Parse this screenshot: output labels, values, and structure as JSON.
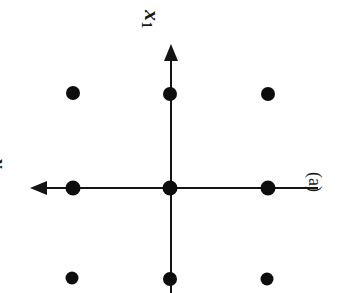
{
  "figure": {
    "caption_label": "(a)",
    "background_color": "#ffffff",
    "ink_color": "#111111",
    "width": 348,
    "height": 293,
    "rotation_note": "90"
  },
  "axes": {
    "vertical": {
      "name": "x1",
      "label_base": "x",
      "label_sub": "1",
      "arrow_direction": "up",
      "x": 170,
      "y_start": 293,
      "y_end": 48
    },
    "horizontal": {
      "name": "x2",
      "label_base": "x",
      "label_sub": "2",
      "arrow_direction": "left",
      "y": 188,
      "x_start": 318,
      "x_end": 33
    }
  },
  "points": [
    {
      "name": "point-top-left",
      "cx": 73,
      "cy": 93,
      "r": 7.0,
      "grid": "(-1, 1)"
    },
    {
      "name": "point-top-center",
      "cx": 170,
      "cy": 94,
      "r": 7.0,
      "grid": "(0, 1)"
    },
    {
      "name": "point-top-right",
      "cx": 268,
      "cy": 94,
      "r": 7.0,
      "grid": "(1, 1)"
    },
    {
      "name": "point-middle-left",
      "cx": 73,
      "cy": 188,
      "r": 7.5,
      "grid": "(-1, 0)"
    },
    {
      "name": "point-origin",
      "cx": 170,
      "cy": 188,
      "r": 7.5,
      "grid": "(0, 0)"
    },
    {
      "name": "point-middle-right",
      "cx": 268,
      "cy": 188,
      "r": 7.5,
      "grid": "(1, 0)"
    },
    {
      "name": "point-bottom-left",
      "cx": 72,
      "cy": 278,
      "r": 6.5,
      "grid": "(-1, -1)"
    },
    {
      "name": "point-bottom-center",
      "cx": 170,
      "cy": 279,
      "r": 7.0,
      "grid": "(0, -1)"
    },
    {
      "name": "point-bottom-right",
      "cx": 267,
      "cy": 279,
      "r": 6.5,
      "grid": "(1, -1)"
    }
  ],
  "chart_data": {
    "type": "scatter",
    "title": "",
    "xlabel": "x2",
    "ylabel": "x1",
    "grid": false,
    "legend": "none",
    "x": [
      -1,
      0,
      1,
      -1,
      0,
      1,
      -1,
      0,
      1
    ],
    "y": [
      1,
      1,
      1,
      0,
      0,
      0,
      -1,
      -1,
      -1
    ],
    "annotations": [
      "(a)"
    ]
  }
}
